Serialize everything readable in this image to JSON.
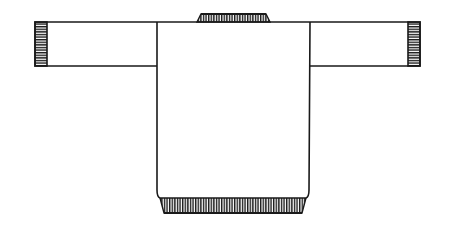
{
  "diagram": {
    "colors": {
      "background": "#ffffff",
      "line": "#1a1a1a",
      "ribbing": "#1a1a1a"
    },
    "parts": [
      {
        "id": "neckband",
        "label": "Neckband ribbing"
      },
      {
        "id": "left-sleeve",
        "label": "Left sleeve"
      },
      {
        "id": "left-cuff",
        "label": "Left cuff ribbing"
      },
      {
        "id": "right-sleeve",
        "label": "Right sleeve"
      },
      {
        "id": "right-cuff",
        "label": "Right cuff ribbing"
      },
      {
        "id": "body",
        "label": "Body"
      },
      {
        "id": "hem",
        "label": "Hem ribbing"
      }
    ]
  }
}
